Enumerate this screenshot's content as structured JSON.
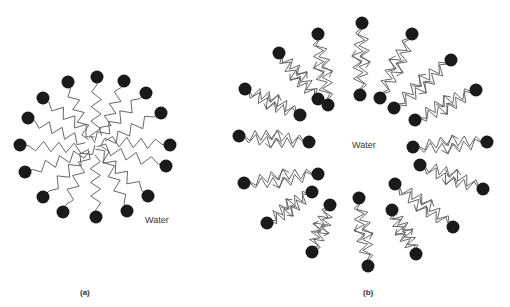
{
  "figure": {
    "panel_a": {
      "caption": "(a)",
      "region_label": "Water",
      "description": "Spherical micelle: polar heads outward facing water, hydrocarbon tails pointing inward",
      "heads": [
        [
          68,
          82
        ],
        [
          97,
          77
        ],
        [
          124,
          81
        ],
        [
          146,
          93
        ],
        [
          161,
          113
        ],
        [
          43,
          98
        ],
        [
          28,
          118
        ],
        [
          20,
          145
        ],
        [
          170,
          145
        ],
        [
          166,
          166
        ],
        [
          25,
          172
        ],
        [
          43,
          197
        ],
        [
          63,
          212
        ],
        [
          96,
          217
        ],
        [
          127,
          211
        ],
        [
          148,
          196
        ]
      ],
      "center": [
        95,
        145
      ]
    },
    "panel_b": {
      "caption": "(b)",
      "region_label": "Water",
      "description": "Bilayer vesicle: outer and inner layers of polar heads with tails meeting in a bilayer, water inside",
      "center": [
        364,
        146
      ],
      "pairs": [
        [
          [
            362,
            23
          ],
          [
            360,
            95
          ]
        ],
        [
          [
            318,
            34
          ],
          [
            328,
            105
          ]
        ],
        [
          [
            279,
            53
          ],
          [
            318,
            99
          ]
        ],
        [
          [
            245,
            89
          ],
          [
            300,
            115
          ]
        ],
        [
          [
            239,
            136
          ],
          [
            309,
            142
          ]
        ],
        [
          [
            244,
            183
          ],
          [
            318,
            174
          ]
        ],
        [
          [
            267,
            223
          ],
          [
            312,
            192
          ]
        ],
        [
          [
            312,
            252
          ],
          [
            330,
            205
          ]
        ],
        [
          [
            368,
            266
          ],
          [
            359,
            198
          ]
        ],
        [
          [
            416,
            254
          ],
          [
            392,
            210
          ]
        ],
        [
          [
            453,
            227
          ],
          [
            395,
            184
          ]
        ],
        [
          [
            483,
            189
          ],
          [
            420,
            165
          ]
        ],
        [
          [
            487,
            142
          ],
          [
            413,
            147
          ]
        ],
        [
          [
            476,
            90
          ],
          [
            415,
            120
          ]
        ],
        [
          [
            451,
            60
          ],
          [
            394,
            108
          ]
        ],
        [
          [
            412,
            34
          ],
          [
            380,
            98
          ]
        ]
      ]
    },
    "colors": {
      "head": "#1a1a1a",
      "tail": "#555555",
      "text": "#333333"
    }
  }
}
